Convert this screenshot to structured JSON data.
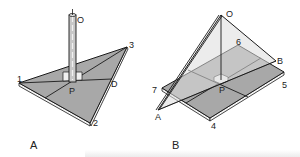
{
  "figure": {
    "panels": [
      {
        "id": "A",
        "caption": "A",
        "description": "Vertical pole standing at point P on a triangular plate with vertices 1, 2, 3; median lines through P",
        "points": {
          "O": "O",
          "P": "P",
          "D": "D",
          "v1": "1",
          "v2": "2",
          "v3": "3"
        }
      },
      {
        "id": "B",
        "caption": "B",
        "description": "Triangular sheet OAB hanging from apex O over a rectangular plate with corners 4, 5, 6, 7; center point P",
        "points": {
          "O": "O",
          "P": "P",
          "A": "A",
          "B": "B",
          "v4": "4",
          "v5": "5",
          "v6": "6",
          "v7": "7"
        }
      }
    ],
    "colors": {
      "plate_fill": "#a8a8a8",
      "plate_edge": "#f2f2f2",
      "sheet_fill": "#dcdcdc",
      "line": "#1a1a1a",
      "pole_fill": "#c8c8c8"
    }
  }
}
